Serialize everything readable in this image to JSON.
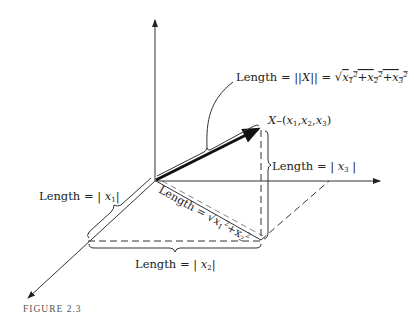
{
  "figure": {
    "caption": "FIGURE 2.3",
    "colors": {
      "ink": "#222222",
      "caption": "#555555",
      "background": "#ffffff"
    },
    "vector_label": "X–(x₁,x₂,x₃)",
    "labels": {
      "norm": "Length = ||X|| = √(x₁²+x₂²+x₃²)",
      "x3": "Length = | x₃ |",
      "x1": "Length = | x₁ |",
      "x2": "Length = | x₂ |",
      "diag": "Length = √(x₁²+x₂²)"
    }
  }
}
